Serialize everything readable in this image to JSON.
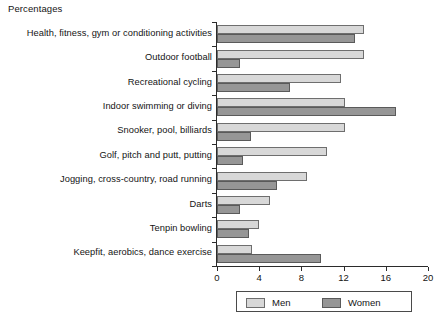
{
  "chart_data": {
    "type": "bar",
    "orientation": "horizontal",
    "title": "Percentages",
    "xlabel": "",
    "ylabel": "",
    "xlim": [
      0,
      20
    ],
    "xticks": [
      0,
      4,
      8,
      12,
      16,
      20
    ],
    "grid": false,
    "legend_position": "bottom",
    "categories": [
      "Health, fitness, gym or conditioning activities",
      "Outdoor football",
      "Recreational cycling",
      "Indoor swimming or diving",
      "Snooker, pool, billiards",
      "Golf, pitch and putt, putting",
      "Jogging, cross-country, road running",
      "Darts",
      "Tenpin bowling",
      "Keepfit, aerobics, dance exercise"
    ],
    "series": [
      {
        "name": "Men",
        "color": "#d8d8d8",
        "values": [
          13.9,
          13.9,
          11.8,
          12.1,
          12.1,
          10.4,
          8.5,
          5.0,
          4.0,
          3.3
        ]
      },
      {
        "name": "Women",
        "color": "#969696",
        "values": [
          13.1,
          2.2,
          6.9,
          17.0,
          3.2,
          2.5,
          5.7,
          2.2,
          3.0,
          9.9
        ]
      }
    ]
  },
  "legend": {
    "items": [
      {
        "label": "Men",
        "swatch": "men"
      },
      {
        "label": "Women",
        "swatch": "women"
      }
    ]
  },
  "footer": {
    "artifact_text": ""
  }
}
